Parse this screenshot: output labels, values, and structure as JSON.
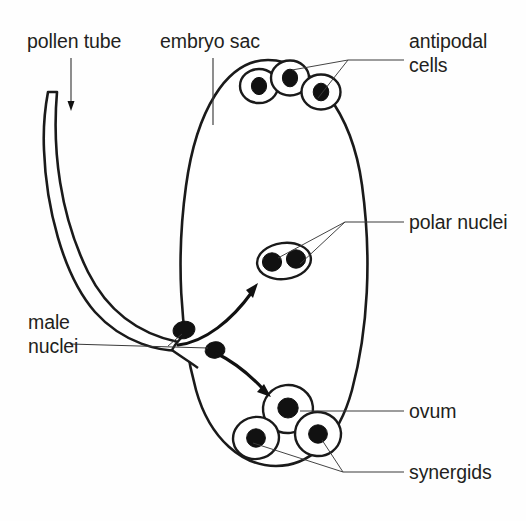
{
  "figure": {
    "background_color": "#ffffff",
    "ink_color": "#1a1a1a",
    "text_color": "#231f20",
    "width": 526,
    "height": 521
  },
  "labels": {
    "pollen_tube": "pollen tube",
    "embryo_sac": "embryo sac",
    "antipodal_cells_line1": "antipodal",
    "antipodal_cells_line2": "cells",
    "polar_nuclei": "polar nuclei",
    "male_nuclei_line1": "male",
    "male_nuclei_line2": "nuclei",
    "ovum": "ovum",
    "synergids": "synergids"
  },
  "structures": {
    "pollen_tube": {
      "name": "pollen tube",
      "description": "curved J-shaped tube entering the embryo sac from upper left",
      "fill_pattern": "stipple"
    },
    "embryo_sac": {
      "name": "embryo sac",
      "description": "large vertical ovoid sac filled with stippled cytoplasm",
      "fill_pattern": "stipple"
    },
    "antipodal_cells": {
      "name": "antipodal cells",
      "count": 3,
      "position": "top of embryo sac",
      "nucleus_color": "#111111"
    },
    "polar_nuclei": {
      "name": "polar nuclei",
      "count": 2,
      "position": "centre of embryo sac",
      "container": "single oval cell",
      "nucleus_color": "#111111"
    },
    "male_nuclei": {
      "name": "male nuclei",
      "count": 2,
      "position": "tip of pollen tube at entry point",
      "nucleus_color": "#111111"
    },
    "ovum": {
      "name": "ovum",
      "count": 1,
      "position": "lower centre of embryo sac",
      "nucleus_color": "#111111"
    },
    "synergids": {
      "name": "synergids",
      "count": 2,
      "position": "bottom of embryo sac flanking the ovum",
      "nucleus_color": "#111111"
    }
  },
  "arrows": [
    {
      "name": "male-nucleus-to-polar-nuclei",
      "from": "male nuclei",
      "to": "polar nuclei",
      "direction": "up and right"
    },
    {
      "name": "male-nucleus-to-ovum",
      "from": "male nuclei",
      "to": "ovum",
      "direction": "down and right"
    }
  ]
}
